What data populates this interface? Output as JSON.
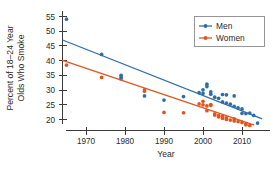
{
  "chart_data": {
    "type": "scatter",
    "title": "",
    "xlabel": "Year",
    "ylabel": "Percent of 18–24 Year Olds Who Smoke",
    "ylabel_line1": "Percent of 18–24 Year",
    "ylabel_line2": "Olds Who Smoke",
    "xlim": [
      1963,
      2016
    ],
    "ylim": [
      17,
      57
    ],
    "xticks": [
      1970,
      1980,
      1990,
      2000,
      2010
    ],
    "xtick_labels": [
      "1970",
      "1980",
      "1990",
      "2000",
      "2010"
    ],
    "yticks": [
      20,
      25,
      30,
      35,
      40,
      45,
      50,
      55
    ],
    "ytick_labels": [
      "20",
      "25",
      "30",
      "35",
      "40",
      "45",
      "50",
      "55"
    ],
    "grid": false,
    "legend_position": "top-right",
    "legend": [
      "Men",
      "Women"
    ],
    "colors": {
      "men": "#2E6FA7",
      "women": "#E0551F",
      "axis": "#3b3b3b",
      "text": "#2b2b2b",
      "legend_border": "#8a8a8a",
      "background": "#ffffff"
    },
    "series": [
      {
        "name": "Men",
        "color": "#2E6FA7",
        "marker": "circle",
        "points": [
          [
            1965,
            54.1
          ],
          [
            1974,
            42.1
          ],
          [
            1979,
            35.0
          ],
          [
            1979,
            34.3
          ],
          [
            1985,
            28.0
          ],
          [
            1990,
            26.6
          ],
          [
            1995,
            27.8
          ],
          [
            1999,
            29.1
          ],
          [
            2000,
            28.9
          ],
          [
            2000,
            30.1
          ],
          [
            2001,
            31.2
          ],
          [
            2001,
            32.0
          ],
          [
            2002,
            29.4
          ],
          [
            2002,
            28.6
          ],
          [
            2003,
            27.6
          ],
          [
            2004,
            27.2
          ],
          [
            2005,
            28.5
          ],
          [
            2005,
            26.0
          ],
          [
            2006,
            28.4
          ],
          [
            2006,
            25.6
          ],
          [
            2007,
            25.2
          ],
          [
            2008,
            28.0
          ],
          [
            2008,
            24.5
          ],
          [
            2009,
            24.0
          ],
          [
            2010,
            23.6
          ],
          [
            2010,
            22.1
          ],
          [
            2011,
            22.0
          ],
          [
            2012,
            22.2
          ],
          [
            2013,
            21.4
          ],
          [
            2014,
            18.8
          ]
        ],
        "trend_line": {
          "x1": 1964,
          "y1": 47.0,
          "x2": 2015,
          "y2": 20.3
        }
      },
      {
        "name": "Women",
        "color": "#E0551F",
        "marker": "circle",
        "points": [
          [
            1965,
            38.5
          ],
          [
            1974,
            34.3
          ],
          [
            1979,
            33.8
          ],
          [
            1985,
            30.1
          ],
          [
            1985,
            29.6
          ],
          [
            1990,
            22.4
          ],
          [
            1995,
            22.3
          ],
          [
            1999,
            25.3
          ],
          [
            2000,
            26.2
          ],
          [
            2000,
            25.0
          ],
          [
            2001,
            24.6
          ],
          [
            2001,
            23.0
          ],
          [
            2002,
            25.1
          ],
          [
            2002,
            24.8
          ],
          [
            2003,
            21.9
          ],
          [
            2003,
            21.5
          ],
          [
            2004,
            21.3
          ],
          [
            2004,
            20.9
          ],
          [
            2005,
            21.1
          ],
          [
            2005,
            20.4
          ],
          [
            2006,
            20.6
          ],
          [
            2006,
            20.0
          ],
          [
            2007,
            19.8
          ],
          [
            2008,
            19.5
          ],
          [
            2008,
            20.2
          ],
          [
            2009,
            19.3
          ],
          [
            2010,
            19.0
          ],
          [
            2011,
            18.5
          ],
          [
            2011,
            18.2
          ],
          [
            2012,
            18.0
          ]
        ],
        "trend_line": {
          "x1": 1964,
          "y1": 40.1,
          "x2": 2013,
          "y2": 18.2
        }
      }
    ]
  },
  "axes": {
    "x_axis_name": "year-axis",
    "y_axis_name": "percent-axis"
  }
}
